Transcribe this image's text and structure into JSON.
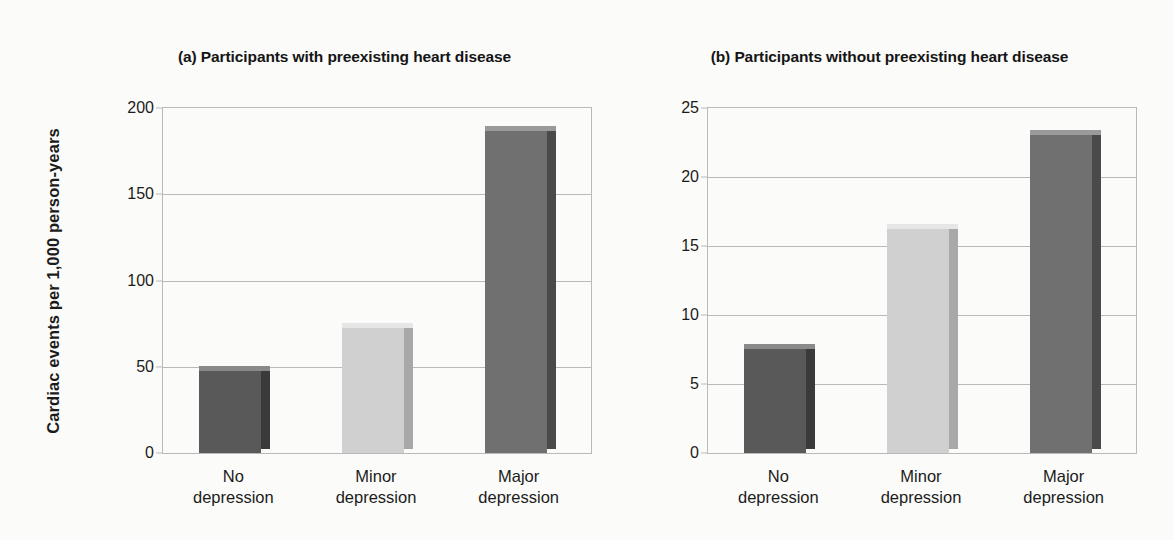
{
  "figure": {
    "ylabel": "Cardiac events per 1,000 person-years",
    "background": "#fbfbfa",
    "axis_color": "#b9b9b9"
  },
  "colors": {
    "dark_gray": "#595959",
    "dark_gray_side": "#3a3a3a",
    "dark_gray_top": "#8a8a8a",
    "light_gray": "#d0d0d0",
    "light_gray_side": "#a8a8a8",
    "light_gray_top": "#e6e6e6",
    "medium_gray": "#707070",
    "medium_gray_side": "#4a4a4a",
    "medium_gray_top": "#9a9a9a"
  },
  "chart_data": [
    {
      "type": "bar",
      "panel": "a",
      "title": "(a) Participants with preexisting heart disease",
      "categories": [
        "No depression",
        "Minor depression",
        "Major depression"
      ],
      "category_lines": [
        [
          "No",
          "depression"
        ],
        [
          "Minor",
          "depression"
        ],
        [
          "Major",
          "depression"
        ]
      ],
      "values": [
        48,
        73,
        187
      ],
      "bar_colors": [
        "dark_gray",
        "light_gray",
        "medium_gray"
      ],
      "xlabel": "",
      "ylabel": "Cardiac events per 1,000 person-years",
      "ylim": [
        0,
        200
      ],
      "yticks": [
        0,
        50,
        100,
        150,
        200
      ],
      "ytick_labels": [
        "0",
        "50",
        "100",
        "150",
        "200"
      ],
      "grid": true,
      "legend": "none"
    },
    {
      "type": "bar",
      "panel": "b",
      "title": "(b) Participants without preexisting heart disease",
      "categories": [
        "No depression",
        "Minor depression",
        "Major depression"
      ],
      "category_lines": [
        [
          "No",
          "depression"
        ],
        [
          "Minor",
          "depression"
        ],
        [
          "Major",
          "depression"
        ]
      ],
      "values": [
        7.6,
        16.3,
        23.1
      ],
      "bar_colors": [
        "dark_gray",
        "light_gray",
        "medium_gray"
      ],
      "xlabel": "",
      "ylabel": "Cardiac events per 1,000 person-years",
      "ylim": [
        0,
        25
      ],
      "yticks": [
        0,
        5,
        10,
        15,
        20,
        25
      ],
      "ytick_labels": [
        "0",
        "5",
        "10",
        "15",
        "20",
        "25"
      ],
      "grid": true,
      "legend": "none"
    }
  ]
}
